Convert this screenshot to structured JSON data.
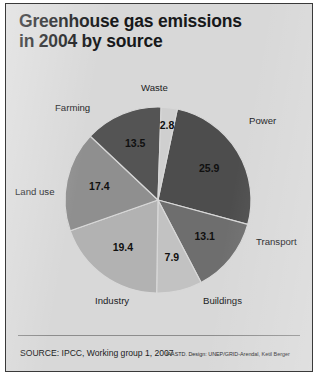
{
  "poster": {
    "title_line1": "Greenhouse gas emissions",
    "title_line2": "in 2004 by source",
    "source": "SOURCE: IPCC, Working group 1, 2007",
    "credit": "IAASTD. Design: UNEP/GRID-Arendal, Ketil Berger",
    "background_color": "#d8d8d8",
    "border_color": "#3a3a3a"
  },
  "chart_data": {
    "type": "pie",
    "title": "Greenhouse gas emissions in 2004 by source",
    "xlabel": "",
    "ylabel": "",
    "unit": "percent",
    "total": 100.0,
    "start_angle_deg": 12,
    "direction": "clockwise",
    "legend": "none (slices labelled directly)",
    "grid": false,
    "categories": [
      "Power",
      "Transport",
      "Buildings",
      "Industry",
      "Land use",
      "Farming",
      "Waste"
    ],
    "values": [
      25.9,
      13.1,
      7.9,
      19.4,
      17.4,
      13.5,
      2.8
    ],
    "colors": [
      "#4d4d4d",
      "#6e6e6e",
      "#c2c2c2",
      "#b2b2b2",
      "#8f8f8f",
      "#545454",
      "#cfcfcf"
    ],
    "slices": [
      {
        "label": "Power",
        "value": 25.9,
        "value_text": "25.9",
        "color": "#4d4d4d"
      },
      {
        "label": "Transport",
        "value": 13.1,
        "value_text": "13.1",
        "color": "#6e6e6e"
      },
      {
        "label": "Buildings",
        "value": 7.9,
        "value_text": "7.9",
        "color": "#c2c2c2"
      },
      {
        "label": "Industry",
        "value": 19.4,
        "value_text": "19.4",
        "color": "#b2b2b2"
      },
      {
        "label": "Land use",
        "value": 17.4,
        "value_text": "17.4",
        "color": "#8f8f8f"
      },
      {
        "label": "Farming",
        "value": 13.5,
        "value_text": "13.5",
        "color": "#545454"
      },
      {
        "label": "Waste",
        "value": 2.8,
        "value_text": "2.8",
        "color": "#cfcfcf"
      }
    ]
  },
  "labels": {
    "waste": {
      "text": "Waste",
      "left": 135,
      "top": 78
    },
    "farming": {
      "text": "Farming",
      "left": 49,
      "top": 98
    },
    "power": {
      "text": "Power",
      "left": 243,
      "top": 111
    },
    "land_use": {
      "text": "Land use",
      "left": 9,
      "top": 182
    },
    "transport": {
      "text": "Transport",
      "left": 250,
      "top": 232
    },
    "industry": {
      "text": "Industry",
      "left": 89,
      "top": 291
    },
    "buildings": {
      "text": "Buildings",
      "left": 197,
      "top": 291
    }
  },
  "geometry": {
    "center_x": 152,
    "center_y": 196,
    "radius": 93,
    "value_label_radius": 60
  }
}
